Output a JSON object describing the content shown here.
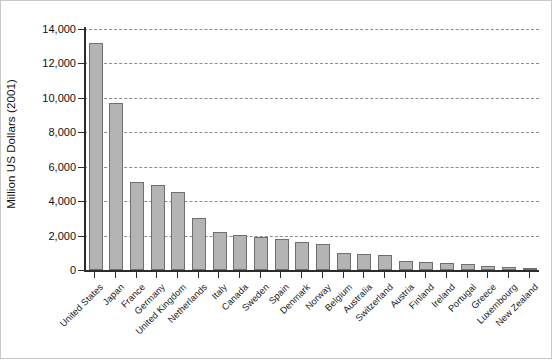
{
  "chart_data": {
    "type": "bar",
    "title": "",
    "xlabel": "",
    "ylabel": "Million US Dollars (2001)",
    "ylim": [
      0,
      14000
    ],
    "ytick_values": [
      0,
      2000,
      4000,
      6000,
      8000,
      10000,
      12000,
      14000
    ],
    "ytick_labels": [
      "0",
      "2,000",
      "4,000",
      "6,000",
      "8,000",
      "10,000",
      "12,000",
      "14,000"
    ],
    "grid": "horizontal-dashed",
    "legend": "none",
    "orientation": "vertical",
    "bar_color": "#b4b4b4",
    "bar_edge_color": "#6f6f6f",
    "axis_color": "#2c2c2c",
    "gridline_color": "#8d8d8d",
    "categories": [
      "United States",
      "Japan",
      "France",
      "Germany",
      "United Kingdom",
      "Netherlands",
      "Italy",
      "Canada",
      "Sweden",
      "Spain",
      "Denmark",
      "Norway",
      "Belgium",
      "Australia",
      "Switzerland",
      "Austria",
      "Finland",
      "Ireland",
      "Portugal",
      "Greece",
      "Luxembourg",
      "New Zealand"
    ],
    "values": [
      13200,
      9700,
      5100,
      4950,
      4550,
      3050,
      2200,
      2050,
      1900,
      1800,
      1600,
      1500,
      1000,
      950,
      900,
      500,
      450,
      400,
      330,
      250,
      180,
      130
    ]
  }
}
